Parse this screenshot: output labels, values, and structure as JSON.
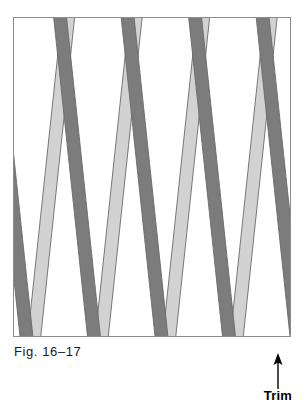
{
  "page": {
    "width": 308,
    "height": 410,
    "background": "#ffffff",
    "cropped_header_text": "·  ·  ·  ·  ·        ·  ·"
  },
  "figure": {
    "caption": "Fig. 16–17",
    "frame": {
      "x": 13,
      "y": 17,
      "width": 278,
      "height": 320,
      "border_color": "#8c8c8c",
      "fill": "#ffffff"
    },
    "lattice": {
      "description": "Diagonal lattice / trellis of crossed flat slats",
      "dark_strip_color": "#7c7c7c",
      "light_strip_color": "#d2d2d2",
      "strip_outline_color": "#6a6a6a",
      "strip_width": 13,
      "dark_direction": "top-left-to-bottom-right",
      "light_direction": "top-right-to-bottom-left",
      "dark_slope_run": 34,
      "light_slope_run": -34,
      "dark_spacing": 68,
      "light_spacing": 68,
      "over_under": "dark strips pass over light strips",
      "dark_count": 9,
      "light_count": 9
    }
  },
  "annotations": {
    "trim": {
      "label": "Trim",
      "arrow_direction": "up",
      "arrow_color": "#000000",
      "label_color": "#000000"
    }
  }
}
